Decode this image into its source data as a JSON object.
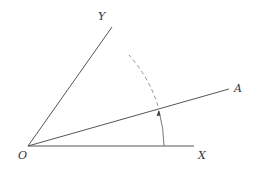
{
  "diagram": {
    "title": "",
    "points": {
      "origin": {
        "label": "O",
        "x": 28,
        "y": 146
      },
      "x_end": {
        "label": "X",
        "x": 194,
        "y": 146
      },
      "y_end": {
        "label": "Y",
        "x": 112,
        "y": 27
      },
      "a_end": {
        "label": "A",
        "x": 229,
        "y": 89
      }
    },
    "labels": {
      "O": "O",
      "X": "X",
      "Y": "Y",
      "A": "A"
    },
    "rays": [
      {
        "name": "OX",
        "from": "O",
        "to": "X"
      },
      {
        "name": "OY",
        "from": "O",
        "to": "Y"
      },
      {
        "name": "OA",
        "from": "O",
        "to": "A"
      }
    ],
    "arc": {
      "center": "O",
      "radius": 136,
      "solid_segment": "from OX up to OA",
      "dashed_segment": "from OA toward OY",
      "arrow": "up, at intersection with OA"
    },
    "colors": {
      "line": "#555555",
      "text": "#333333"
    }
  }
}
